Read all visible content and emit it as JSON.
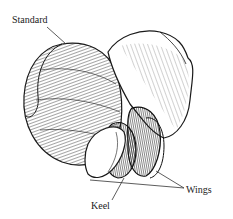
{
  "figure": {
    "labels": {
      "standard": "Standard",
      "keel": "Keel",
      "wings": "Wings"
    },
    "colors": {
      "ink": "#1a1a1a",
      "paper": "#ffffff",
      "shade": "#3a3a3a"
    }
  }
}
